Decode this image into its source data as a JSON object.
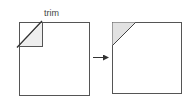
{
  "diagram": {
    "label": "trim",
    "colors": {
      "stroke": "#555555",
      "shade": "#e2e2e2",
      "background": "#ffffff"
    },
    "left_panel": {
      "description": "square with corner to trim"
    },
    "arrow": {
      "direction": "right"
    },
    "right_panel": {
      "description": "square with trimmed corner shaded"
    }
  }
}
